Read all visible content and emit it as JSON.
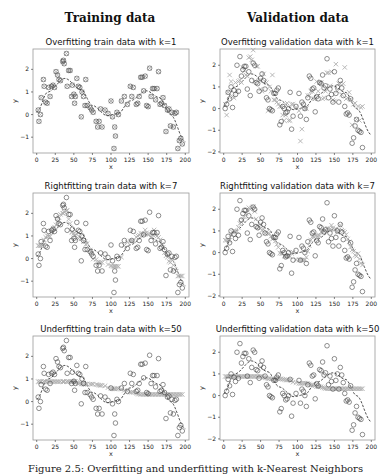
{
  "column_titles": [
    "Training data",
    "Validation data"
  ],
  "caption": "Figure 2.5: Overfitting and underfitting with k-Nearest Neighbors",
  "colors": {
    "circle": "#444444",
    "cross": "#b0b0b0",
    "curve": "#222222",
    "frame": "#999999"
  },
  "chart_data": [
    {
      "type": "scatter",
      "title": "Overfitting train data with k=1",
      "xlabel": "x",
      "ylabel": "y",
      "xlim": [
        -5,
        205
      ],
      "ylim": [
        -1.7,
        2.9
      ],
      "xticks": [
        0,
        25,
        50,
        75,
        100,
        125,
        150,
        175,
        200
      ],
      "yticks": [
        -1,
        0,
        1,
        2
      ],
      "k": 1,
      "dataset": "train",
      "grid": false,
      "legend": null,
      "col": 0,
      "row": 0
    },
    {
      "type": "scatter",
      "title": "Overfitting validation data with k=1",
      "xlabel": "x",
      "ylabel": "y",
      "xlim": [
        -5,
        205
      ],
      "ylim": [
        -2.05,
        2.75
      ],
      "xticks": [
        0,
        25,
        50,
        75,
        100,
        125,
        150,
        175,
        200
      ],
      "yticks": [
        -2,
        -1,
        0,
        1,
        2
      ],
      "k": 1,
      "dataset": "validation",
      "grid": false,
      "legend": null,
      "col": 1,
      "row": 0
    },
    {
      "type": "scatter",
      "title": "Rightfitting train data with k=7",
      "xlabel": "x",
      "ylabel": "y",
      "xlim": [
        -5,
        205
      ],
      "ylim": [
        -1.7,
        2.9
      ],
      "xticks": [
        0,
        25,
        50,
        75,
        100,
        125,
        150,
        175,
        200
      ],
      "yticks": [
        -1,
        0,
        1,
        2
      ],
      "k": 7,
      "dataset": "train",
      "grid": false,
      "legend": null,
      "col": 0,
      "row": 1
    },
    {
      "type": "scatter",
      "title": "Rightfitting validation data with k=7",
      "xlabel": "x",
      "ylabel": "y",
      "xlim": [
        -5,
        205
      ],
      "ylim": [
        -2.05,
        2.75
      ],
      "xticks": [
        0,
        25,
        50,
        75,
        100,
        125,
        150,
        175,
        200
      ],
      "yticks": [
        -2,
        -1,
        0,
        1,
        2
      ],
      "k": 7,
      "dataset": "validation",
      "grid": false,
      "legend": null,
      "col": 1,
      "row": 1
    },
    {
      "type": "scatter",
      "title": "Underfitting train data with k=50",
      "xlabel": "x",
      "ylabel": "y",
      "xlim": [
        -5,
        205
      ],
      "ylim": [
        -1.7,
        2.9
      ],
      "xticks": [
        0,
        25,
        50,
        75,
        100,
        125,
        150,
        175,
        200
      ],
      "yticks": [
        -1,
        0,
        1,
        2
      ],
      "k": 50,
      "dataset": "train",
      "grid": false,
      "legend": null,
      "col": 0,
      "row": 2
    },
    {
      "type": "scatter",
      "title": "Underfitting validation data with k=50",
      "xlabel": "x",
      "ylabel": "y",
      "xlim": [
        -5,
        205
      ],
      "ylim": [
        -2.05,
        2.75
      ],
      "xticks": [
        0,
        25,
        50,
        75,
        100,
        125,
        150,
        175,
        200
      ],
      "yticks": [
        -2,
        -1,
        0,
        1,
        2
      ],
      "k": 50,
      "dataset": "validation",
      "grid": false,
      "legend": null,
      "col": 1,
      "row": 2
    }
  ],
  "train_points": [
    [
      2,
      0.2
    ],
    [
      3,
      -0.3
    ],
    [
      5,
      0.0
    ],
    [
      6,
      0.75
    ],
    [
      9,
      1.55
    ],
    [
      10,
      1.25
    ],
    [
      12,
      0.55
    ],
    [
      14,
      0.5
    ],
    [
      16,
      1.2
    ],
    [
      18,
      0.8
    ],
    [
      20,
      1.25
    ],
    [
      22,
      1.3
    ],
    [
      24,
      1.2
    ],
    [
      26,
      1.9
    ],
    [
      28,
      1.75
    ],
    [
      30,
      1.55
    ],
    [
      32,
      1.5
    ],
    [
      35,
      2.35
    ],
    [
      36,
      2.4
    ],
    [
      37,
      2.25
    ],
    [
      40,
      2.7
    ],
    [
      41,
      1.25
    ],
    [
      43,
      1.95
    ],
    [
      45,
      1.95
    ],
    [
      47,
      0.8
    ],
    [
      48,
      1.3
    ],
    [
      50,
      0.9
    ],
    [
      51,
      0.5
    ],
    [
      52,
      0.8
    ],
    [
      54,
      1.6
    ],
    [
      56,
      1.25
    ],
    [
      58,
      1.2
    ],
    [
      60,
      -0.1
    ],
    [
      61,
      1.0
    ],
    [
      63,
      0.8
    ],
    [
      65,
      0.4
    ],
    [
      66,
      1.55
    ],
    [
      68,
      0.4
    ],
    [
      72,
      0.3
    ],
    [
      74,
      0.2
    ],
    [
      76,
      0.1
    ],
    [
      80,
      -0.3
    ],
    [
      82,
      -0.55
    ],
    [
      84,
      -0.3
    ],
    [
      86,
      0.25
    ],
    [
      88,
      -0.55
    ],
    [
      92,
      0.2
    ],
    [
      96,
      0.05
    ],
    [
      100,
      0.6
    ],
    [
      102,
      -0.1
    ],
    [
      104,
      -1.5
    ],
    [
      105,
      -0.55
    ],
    [
      106,
      -0.95
    ],
    [
      108,
      0.1
    ],
    [
      110,
      0.0
    ],
    [
      114,
      0.6
    ],
    [
      118,
      0.8
    ],
    [
      122,
      0.45
    ],
    [
      126,
      1.25
    ],
    [
      128,
      0.8
    ],
    [
      130,
      1.2
    ],
    [
      134,
      0.45
    ],
    [
      136,
      0.5
    ],
    [
      138,
      0.8
    ],
    [
      140,
      1.65
    ],
    [
      142,
      1.65
    ],
    [
      144,
      1.05
    ],
    [
      146,
      1.7
    ],
    [
      148,
      0.4
    ],
    [
      150,
      0.35
    ],
    [
      152,
      2.05
    ],
    [
      154,
      0.8
    ],
    [
      156,
      1.15
    ],
    [
      158,
      1.15
    ],
    [
      160,
      0.65
    ],
    [
      162,
      1.15
    ],
    [
      164,
      1.9
    ],
    [
      166,
      0.45
    ],
    [
      168,
      0.5
    ],
    [
      170,
      0.75
    ],
    [
      172,
      0.4
    ],
    [
      174,
      -0.75
    ],
    [
      176,
      0.2
    ],
    [
      178,
      0.25
    ],
    [
      180,
      -0.5
    ],
    [
      182,
      0.1
    ],
    [
      184,
      -0.55
    ],
    [
      186,
      0.05
    ],
    [
      188,
      0.1
    ],
    [
      190,
      -1.5
    ],
    [
      192,
      -1.15
    ],
    [
      194,
      -1.05
    ],
    [
      196,
      -1.3
    ]
  ],
  "val_points": [
    [
      2,
      0.0
    ],
    [
      4,
      0.2
    ],
    [
      6,
      0.75
    ],
    [
      8,
      0.45
    ],
    [
      10,
      1.0
    ],
    [
      12,
      0.05
    ],
    [
      14,
      0.85
    ],
    [
      16,
      0.65
    ],
    [
      18,
      2.0
    ],
    [
      20,
      0.8
    ],
    [
      22,
      2.4
    ],
    [
      24,
      1.5
    ],
    [
      26,
      1.8
    ],
    [
      28,
      1.95
    ],
    [
      30,
      1.95
    ],
    [
      32,
      0.9
    ],
    [
      34,
      1.7
    ],
    [
      36,
      0.6
    ],
    [
      38,
      1.3
    ],
    [
      40,
      2.1
    ],
    [
      42,
      2.0
    ],
    [
      44,
      1.2
    ],
    [
      46,
      1.15
    ],
    [
      48,
      0.8
    ],
    [
      50,
      1.4
    ],
    [
      52,
      1.6
    ],
    [
      54,
      1.3
    ],
    [
      56,
      0.9
    ],
    [
      58,
      0.5
    ],
    [
      60,
      0.4
    ],
    [
      62,
      0.0
    ],
    [
      64,
      -0.05
    ],
    [
      66,
      -0.1
    ],
    [
      68,
      0.7
    ],
    [
      70,
      0.7
    ],
    [
      72,
      0.85
    ],
    [
      74,
      0.95
    ],
    [
      76,
      -0.75
    ],
    [
      78,
      -0.6
    ],
    [
      80,
      0.1
    ],
    [
      82,
      0.0
    ],
    [
      84,
      -0.2
    ],
    [
      86,
      -0.15
    ],
    [
      88,
      0.0
    ],
    [
      90,
      0.75
    ],
    [
      92,
      -0.95
    ],
    [
      94,
      -0.35
    ],
    [
      98,
      0.1
    ],
    [
      102,
      0.7
    ],
    [
      104,
      -0.35
    ],
    [
      106,
      0.3
    ],
    [
      108,
      0.2
    ],
    [
      110,
      0.0
    ],
    [
      112,
      -0.5
    ],
    [
      114,
      0.5
    ],
    [
      116,
      1.5
    ],
    [
      118,
      1.4
    ],
    [
      120,
      0.9
    ],
    [
      122,
      0.95
    ],
    [
      124,
      -0.15
    ],
    [
      126,
      0.55
    ],
    [
      128,
      0.45
    ],
    [
      130,
      1.2
    ],
    [
      132,
      1.15
    ],
    [
      134,
      1.55
    ],
    [
      136,
      0.95
    ],
    [
      138,
      1.05
    ],
    [
      140,
      2.3
    ],
    [
      142,
      0.5
    ],
    [
      144,
      0.9
    ],
    [
      146,
      0.65
    ],
    [
      148,
      0.3
    ],
    [
      150,
      1.7
    ],
    [
      152,
      0.7
    ],
    [
      154,
      1.0
    ],
    [
      156,
      0.3
    ],
    [
      158,
      1.3
    ],
    [
      160,
      0.95
    ],
    [
      162,
      0.6
    ],
    [
      164,
      0.1
    ],
    [
      166,
      -0.25
    ],
    [
      168,
      -0.2
    ],
    [
      170,
      -0.3
    ],
    [
      172,
      0.45
    ],
    [
      174,
      -1.6
    ],
    [
      176,
      -1.35
    ],
    [
      178,
      -0.8
    ],
    [
      180,
      -0.5
    ],
    [
      182,
      -1.0
    ],
    [
      184,
      -1.05
    ],
    [
      186,
      -1.1
    ],
    [
      188,
      -1.8
    ]
  ]
}
